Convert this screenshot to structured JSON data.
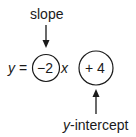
{
  "diagram": {
    "slope_label": "slope",
    "intercept_label_var": "y",
    "intercept_label_rest": "-intercept",
    "equation": {
      "lhs_var": "y",
      "equals": "=",
      "slope_value": "−2",
      "x_var": "x",
      "intercept_value": "+ 4"
    },
    "colors": {
      "ink": "#1a1a1a",
      "background": "#ffffff"
    }
  }
}
